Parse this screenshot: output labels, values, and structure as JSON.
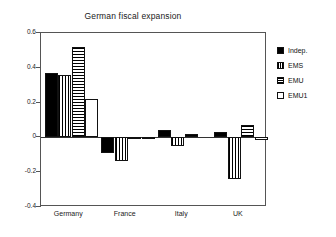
{
  "chart_data": {
    "type": "bar",
    "title": "German fiscal expansion",
    "xlabel": "",
    "ylabel": "",
    "categories": [
      "Germany",
      "France",
      "Italy",
      "UK"
    ],
    "series": [
      {
        "name": "Indep.",
        "pattern": "solid",
        "values": [
          0.37,
          -0.09,
          0.045,
          0.03
        ]
      },
      {
        "name": "EMS",
        "pattern": "vert",
        "values": [
          0.36,
          -0.135,
          -0.05,
          -0.24
        ]
      },
      {
        "name": "EMU",
        "pattern": "horiz",
        "values": [
          0.52,
          -0.01,
          0.02,
          0.07
        ]
      },
      {
        "name": "EMU1",
        "pattern": "empty",
        "values": [
          0.22,
          -0.012,
          0.0,
          -0.015
        ]
      }
    ],
    "ylim": [
      -0.4,
      0.6
    ],
    "yticks": [
      "0.6",
      "0.4",
      "0.2",
      "0",
      "-0.2",
      "-0.4"
    ],
    "ytick_values": [
      0.6,
      0.4,
      0.2,
      0,
      -0.2,
      -0.4
    ],
    "grid": false,
    "legend_position": "right",
    "zero_line": 0
  },
  "legend": {
    "items": [
      {
        "label": "Indep."
      },
      {
        "label": "EMS"
      },
      {
        "label": "EMU"
      },
      {
        "label": "EMU1"
      }
    ]
  }
}
